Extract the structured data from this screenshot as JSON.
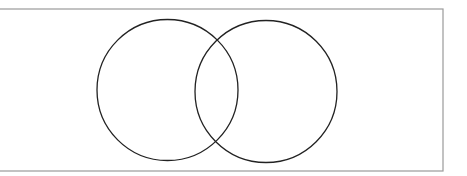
{
  "diagram": {
    "type": "venn",
    "frame": {
      "x": -2,
      "y": 9,
      "width": 445,
      "height": 162,
      "stroke": "#9a9a9a"
    },
    "circles": [
      {
        "name": "set-a",
        "cx": 167.5,
        "cy": 90,
        "r": 70.5,
        "stroke": "#222222"
      },
      {
        "name": "set-b",
        "cx": 266,
        "cy": 91.5,
        "r": 71,
        "stroke": "#222222"
      }
    ],
    "labels": []
  }
}
